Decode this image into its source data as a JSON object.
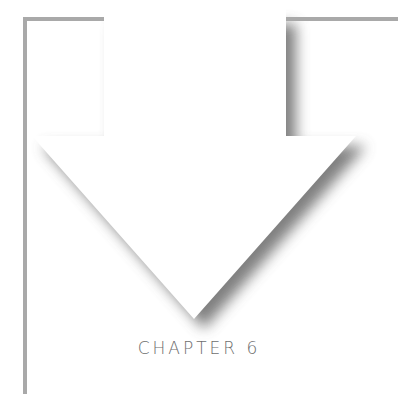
{
  "caption": "CHAPTER 6",
  "colors": {
    "frame": "#a9a9a9",
    "shadow": "#444444",
    "arrow_fill": "#ffffff",
    "text": "#6e6e6e"
  },
  "icon": "down-arrow-icon"
}
